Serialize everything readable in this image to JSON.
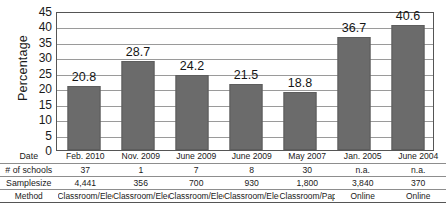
{
  "chart_data": {
    "type": "bar",
    "title": "",
    "xlabel": "",
    "ylabel": "Percentage",
    "ylim": [
      0,
      45
    ],
    "yticks": [
      0,
      5,
      10,
      15,
      20,
      25,
      30,
      35,
      40,
      45
    ],
    "grid": true,
    "legend": "none",
    "bar_color": "#6b6b6b",
    "categories": [
      "Feb. 2010",
      "Nov. 2009",
      "June 2009",
      "June 2009",
      "May 2007",
      "Jan. 2005",
      "June 2004"
    ],
    "values": [
      20.8,
      28.7,
      24.2,
      21.5,
      18.8,
      36.7,
      40.6
    ],
    "data_labels": [
      "20.8",
      "28.7",
      "24.2",
      "21.5",
      "18.8",
      "36.7",
      "40.6"
    ]
  },
  "table": {
    "rows": [
      {
        "label": "Date",
        "cells": [
          "Feb. 2010",
          "Nov. 2009",
          "June 2009",
          "June 2009",
          "May 2007",
          "Jan. 2005",
          "June 2004"
        ]
      },
      {
        "label": "# of schools",
        "cells": [
          "37",
          "1",
          "7",
          "8",
          "30",
          "n.a.",
          "n.a."
        ]
      },
      {
        "label": "Samplesize",
        "cells": [
          "4,441",
          "356",
          "700",
          "930",
          "1,800",
          "3,840",
          "370"
        ]
      },
      {
        "label": "Method",
        "cells": [
          "Classroom/Elec",
          "Classroom/Elec",
          "Classroom/Elec",
          "Classroom/Elec",
          "Classroom/Paper",
          "Online",
          "Online"
        ]
      }
    ]
  }
}
